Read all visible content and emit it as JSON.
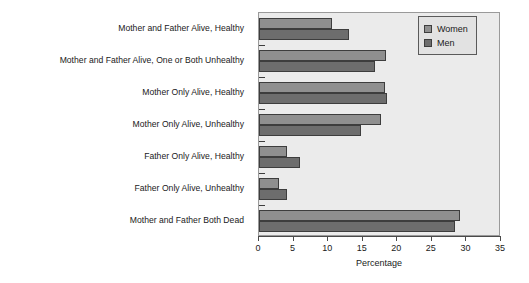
{
  "chart_data": {
    "type": "bar",
    "orientation": "horizontal",
    "title": "",
    "xlabel": "Percentage",
    "ylabel": "",
    "xlim": [
      0,
      35
    ],
    "xticks": [
      0,
      5,
      10,
      15,
      20,
      25,
      30,
      35
    ],
    "xticklabels": [
      "0",
      "5",
      "10",
      "15",
      "20",
      "25",
      "30",
      "35"
    ],
    "grid": false,
    "legend_position": "top-right",
    "categories": [
      "Mother and Father Alive, Healthy",
      "Mother and Father Alive, One or Both Unhealthy",
      "Mother Only Alive, Healthy",
      "Mother Only Alive, Unhealthy",
      "Father Only Alive, Healthy",
      "Father Only Alive, Unhealthy",
      "Mother and Father Both Dead"
    ],
    "series": [
      {
        "name": "Women",
        "color": "#8f8f8f",
        "values": [
          10.6,
          18.3,
          18.2,
          17.7,
          4.1,
          2.9,
          29.0
        ]
      },
      {
        "name": "Men",
        "color": "#6d6d6d",
        "values": [
          13.0,
          16.8,
          18.5,
          14.8,
          5.9,
          4.1,
          28.4
        ]
      }
    ]
  },
  "legend": {
    "items": [
      {
        "label": "Women",
        "swatch": "women"
      },
      {
        "label": "Men",
        "swatch": "men"
      }
    ]
  },
  "colors": {
    "women": "#8f8f8f",
    "men": "#6d6d6d",
    "plot_background": "#ebebeb",
    "axis": "#4a4a4a",
    "bar_edge": "#3d3d3d",
    "text": "#1a1a1a"
  }
}
